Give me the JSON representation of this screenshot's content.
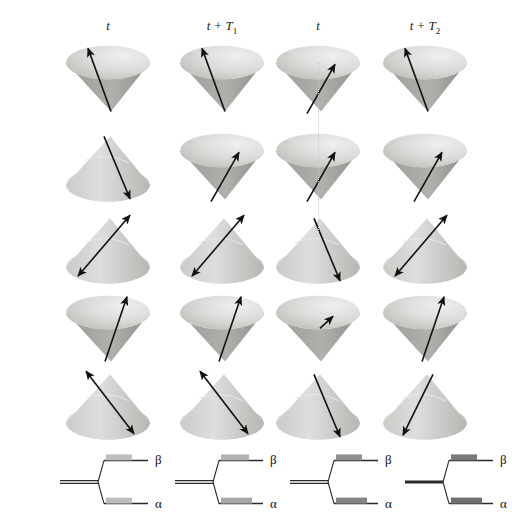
{
  "figure": {
    "width": 482,
    "height": 522,
    "background": "#ffffff"
  },
  "columns": [
    {
      "id": "c1",
      "label": "t",
      "sub": "",
      "x": 108
    },
    {
      "id": "c2",
      "label": "t + T",
      "sub": "1",
      "x": 222
    },
    {
      "id": "c3",
      "label": "t",
      "sub": "",
      "x": 318
    },
    {
      "id": "c4",
      "label": "t + T",
      "sub": "2",
      "x": 425
    }
  ],
  "colors": {
    "cone_light": "#e4e4e2",
    "cone_mid": "#c9c9c6",
    "cone_dark": "#a9a9a5",
    "cone_shadow": "#8e8e8a",
    "arrow": "#111111",
    "level_line": "#2b2b2b",
    "guide_dotted": "#c8c8c8",
    "pop_light": "#bdbdbd",
    "pop_mid": "#a0a0a0",
    "pop_dark": "#808080",
    "pop_darkest": "#6f6f6f"
  },
  "cone_grid": {
    "rows": 5,
    "cols": 4,
    "cells": [
      {
        "row": 1,
        "col": 1,
        "orientation": "down",
        "arrow": "up-left-long",
        "cx": 108,
        "cy": 78
      },
      {
        "row": 1,
        "col": 2,
        "orientation": "down",
        "arrow": "up-left-long",
        "cx": 222,
        "cy": 78
      },
      {
        "row": 1,
        "col": 3,
        "orientation": "down",
        "arrow": "up-right-short",
        "cx": 318,
        "cy": 78
      },
      {
        "row": 1,
        "col": 4,
        "orientation": "down",
        "arrow": "up-left-long",
        "cx": 425,
        "cy": 78
      },
      {
        "row": 2,
        "col": 1,
        "orientation": "up",
        "arrow": "down-right-long",
        "cx": 108,
        "cy": 166
      },
      {
        "row": 2,
        "col": 2,
        "orientation": "down",
        "arrow": "up-right-short",
        "cx": 222,
        "cy": 166
      },
      {
        "row": 2,
        "col": 3,
        "orientation": "down",
        "arrow": "up-right-short",
        "cx": 318,
        "cy": 166
      },
      {
        "row": 2,
        "col": 4,
        "orientation": "down",
        "arrow": "up-right-short",
        "cx": 425,
        "cy": 166
      },
      {
        "row": 3,
        "col": 1,
        "orientation": "up",
        "arrow": "double-down-left",
        "cx": 108,
        "cy": 248
      },
      {
        "row": 3,
        "col": 2,
        "orientation": "up",
        "arrow": "double-down-left",
        "cx": 222,
        "cy": 248
      },
      {
        "row": 3,
        "col": 3,
        "orientation": "up",
        "arrow": "down-right-long",
        "cx": 318,
        "cy": 248
      },
      {
        "row": 3,
        "col": 4,
        "orientation": "up",
        "arrow": "double-down-left",
        "cx": 425,
        "cy": 248
      },
      {
        "row": 4,
        "col": 1,
        "orientation": "down",
        "arrow": "up-right-long",
        "cx": 108,
        "cy": 328
      },
      {
        "row": 4,
        "col": 2,
        "orientation": "down",
        "arrow": "up-right-long",
        "cx": 222,
        "cy": 328
      },
      {
        "row": 4,
        "col": 3,
        "orientation": "down",
        "arrow": "up-right-tiny",
        "cx": 318,
        "cy": 328
      },
      {
        "row": 4,
        "col": 4,
        "orientation": "down",
        "arrow": "up-right-long",
        "cx": 425,
        "cy": 328
      },
      {
        "row": 5,
        "col": 1,
        "orientation": "up",
        "arrow": "double-down-right",
        "cx": 108,
        "cy": 404
      },
      {
        "row": 5,
        "col": 2,
        "orientation": "up",
        "arrow": "double-down-right",
        "cx": 222,
        "cy": 404
      },
      {
        "row": 5,
        "col": 3,
        "orientation": "up",
        "arrow": "down-right-long",
        "cx": 318,
        "cy": 404
      },
      {
        "row": 5,
        "col": 4,
        "orientation": "up",
        "arrow": "down-left-long",
        "cx": 425,
        "cy": 404
      }
    ]
  },
  "guide_line": {
    "type": "vertical-dotted",
    "x": 318,
    "y_top": 62,
    "y_bottom": 232
  },
  "energy_levels": {
    "beta_label": "β",
    "alpha_label": "α",
    "diagrams": [
      {
        "col": 1,
        "cx": 60,
        "base_thick": false,
        "beta_pop_width": 26,
        "beta_pop_color": "#bdbdbd",
        "alpha_pop_width": 26,
        "alpha_pop_color": "#bdbdbd"
      },
      {
        "col": 2,
        "cx": 175,
        "base_thick": false,
        "beta_pop_width": 28,
        "beta_pop_color": "#b3b3b3",
        "alpha_pop_width": 31,
        "alpha_pop_color": "#a8a8a8"
      },
      {
        "col": 3,
        "cx": 290,
        "base_thick": false,
        "beta_pop_width": 26,
        "beta_pop_color": "#8f8f8f",
        "alpha_pop_width": 31,
        "alpha_pop_color": "#848484"
      },
      {
        "col": 4,
        "cx": 405,
        "base_thick": true,
        "beta_pop_width": 26,
        "beta_pop_color": "#7a7a7a",
        "alpha_pop_width": 31,
        "alpha_pop_color": "#6f6f6f"
      }
    ]
  }
}
